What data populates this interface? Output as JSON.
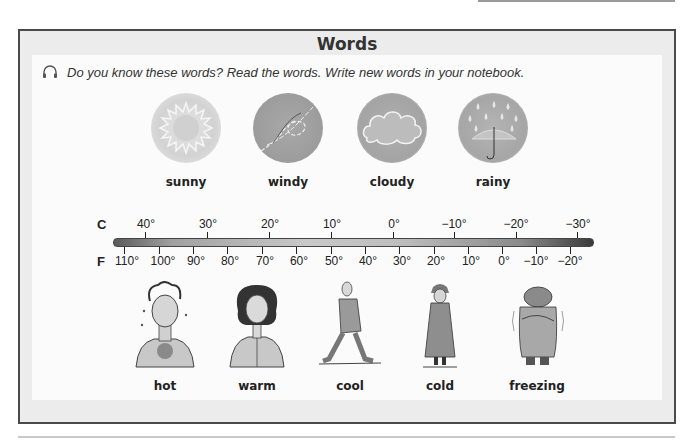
{
  "section": {
    "title": "Words",
    "instruction": "Do you know these words? Read the words.  Write new words in your notebook.",
    "audio_icon": "headphones-icon"
  },
  "weather": [
    {
      "label": "sunny",
      "icon": "sun-icon"
    },
    {
      "label": "windy",
      "icon": "wind-icon"
    },
    {
      "label": "cloudy",
      "icon": "cloud-icon"
    },
    {
      "label": "rainy",
      "icon": "rain-umbrella-icon"
    }
  ],
  "thermometer": {
    "celsius_label": "C",
    "fahrenheit_label": "F",
    "celsius_ticks": [
      "40°",
      "30°",
      "20°",
      "10°",
      "0°",
      "−10°",
      "−20°",
      "−30°"
    ],
    "fahrenheit_ticks": [
      "110°",
      "100°",
      "90°",
      "80°",
      "70°",
      "60°",
      "50°",
      "40°",
      "30°",
      "20°",
      "10°",
      "0°",
      "−10°",
      "−20°"
    ]
  },
  "feelings": [
    {
      "label": "hot"
    },
    {
      "label": "warm"
    },
    {
      "label": "cool"
    },
    {
      "label": "cold"
    },
    {
      "label": "freezing"
    }
  ]
}
